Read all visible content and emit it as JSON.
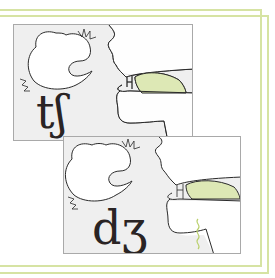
{
  "figure": {
    "colors": {
      "background": "#ffffff",
      "frame": "#d6e3a3",
      "panel_background": "#efefef",
      "panel_border": "#a9a9a9",
      "tongue_fill": "#dde8b5",
      "line": "#2a2a2a",
      "voicing": "#b8cf6a"
    },
    "panels": [
      {
        "symbol": "tʃ",
        "label": "voiceless postalveolar affricate",
        "voiced": false,
        "icons": [
          "head-profile-icon",
          "burst-icon",
          "tongue-icon"
        ]
      },
      {
        "symbol": "dʒ",
        "label": "voiced postalveolar affricate",
        "voiced": true,
        "icons": [
          "head-profile-icon",
          "burst-icon",
          "tongue-icon",
          "voicing-wave-icon"
        ]
      }
    ]
  }
}
